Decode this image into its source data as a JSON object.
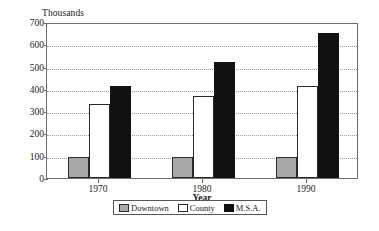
{
  "chart_data": {
    "type": "bar",
    "title": "",
    "ylabel": "Thousands",
    "xlabel": "Year",
    "categories": [
      "1970",
      "1980",
      "1990"
    ],
    "series": [
      {
        "name": "Downtown",
        "values": [
          95,
          95,
          95
        ],
        "color": "#a8a8a8"
      },
      {
        "name": "County",
        "values": [
          330,
          370,
          415
        ],
        "color": "#ffffff"
      },
      {
        "name": "M.S.A.",
        "values": [
          415,
          520,
          650
        ],
        "color": "#111111"
      }
    ],
    "ylim": [
      0,
      700
    ],
    "ytick_values": [
      0,
      100,
      200,
      300,
      400,
      500,
      600,
      700
    ],
    "ytick_labels": [
      "0",
      "100",
      "200",
      "300",
      "400",
      "500",
      "600",
      "700"
    ],
    "grid": true,
    "legend_position": "bottom-center"
  },
  "legend": {
    "entries": [
      {
        "label": "Downtown",
        "swatch": "downtown-swatch"
      },
      {
        "label": "County",
        "swatch": "county-swatch"
      },
      {
        "label": "M.S.A.",
        "swatch": "msa-swatch"
      }
    ]
  }
}
